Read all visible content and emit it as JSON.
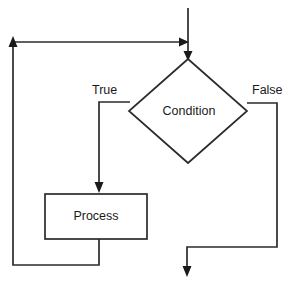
{
  "diagram": {
    "type": "flowchart",
    "background_color": "#ffffff",
    "line_color": "#2b2b2b",
    "text_color": "#1a1a1a",
    "nodes": [
      {
        "id": "condition",
        "shape": "diamond",
        "label": "Condition",
        "cx": 188,
        "cy": 111,
        "half_width": 59,
        "half_height": 52
      },
      {
        "id": "process",
        "shape": "rectangle",
        "label": "Process",
        "x": 45,
        "y": 194,
        "width": 102,
        "height": 45
      }
    ],
    "edge_labels": [
      {
        "id": "true-branch",
        "text": "True",
        "x": 92,
        "y": 94
      },
      {
        "id": "false-branch",
        "text": "False",
        "x": 252,
        "y": 94
      }
    ],
    "edges": [
      {
        "id": "entry-edge",
        "from": "start",
        "to": "condition",
        "path": "M 188 8 L 188 56",
        "arrow": "down"
      },
      {
        "id": "loopback-join-edge",
        "from": "process",
        "to": "condition",
        "path": "M 13 42 L 186 42",
        "arrow": "right"
      },
      {
        "id": "true-edge",
        "from": "condition",
        "to": "process",
        "path": "M 130 102 L 99 102 L 99 191",
        "arrow": "down"
      },
      {
        "id": "false-edge",
        "from": "condition",
        "to": "end",
        "path": "M 247 103 L 277 103 L 277 247 L 187 247 L 187 274",
        "arrow": "down"
      },
      {
        "id": "loopback-edge",
        "from": "process",
        "to": "loopback-join",
        "path": "M 99 239 L 99 265 L 13 265 L 13 44",
        "arrow": "up"
      }
    ]
  }
}
